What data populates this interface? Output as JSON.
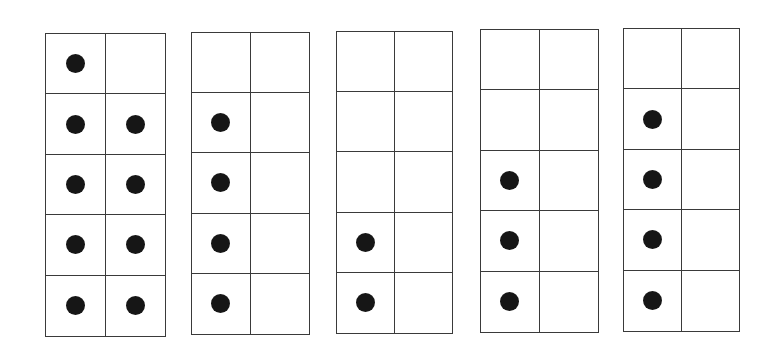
{
  "colors": {
    "line": "#3a3a3a",
    "dot": "#161616",
    "background": "#ffffff"
  },
  "frames": [
    {
      "id": "frame-1",
      "count": 9,
      "rect": [
        45,
        33,
        121,
        304
      ],
      "dots": [
        [
          0,
          0
        ],
        [
          1,
          0
        ],
        [
          1,
          1
        ],
        [
          2,
          0
        ],
        [
          2,
          1
        ],
        [
          3,
          0
        ],
        [
          3,
          1
        ],
        [
          4,
          0
        ],
        [
          4,
          1
        ]
      ]
    },
    {
      "id": "frame-2",
      "count": 4,
      "rect": [
        191,
        32,
        119,
        303
      ],
      "dots": [
        [
          1,
          0
        ],
        [
          2,
          0
        ],
        [
          3,
          0
        ],
        [
          4,
          0
        ]
      ]
    },
    {
      "id": "frame-3",
      "count": 2,
      "rect": [
        336,
        31,
        117,
        303
      ],
      "dots": [
        [
          3,
          0
        ],
        [
          4,
          0
        ]
      ]
    },
    {
      "id": "frame-4",
      "count": 3,
      "rect": [
        480,
        29,
        119,
        304
      ],
      "dots": [
        [
          2,
          0
        ],
        [
          3,
          0
        ],
        [
          4,
          0
        ]
      ]
    },
    {
      "id": "frame-5",
      "count": 4,
      "rect": [
        623,
        28,
        117,
        304
      ],
      "dots": [
        [
          1,
          0
        ],
        [
          2,
          0
        ],
        [
          3,
          0
        ],
        [
          4,
          0
        ]
      ]
    }
  ]
}
